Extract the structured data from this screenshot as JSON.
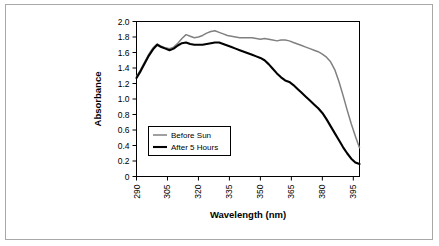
{
  "chart_data": {
    "type": "line",
    "title": "",
    "xlabel": "Wavelength (nm)",
    "ylabel": "Absorbance",
    "xlim": [
      290,
      398
    ],
    "ylim": [
      0,
      2.0
    ],
    "xticks": [
      290,
      305,
      320,
      335,
      350,
      365,
      380,
      395
    ],
    "xtick_labels": [
      "290",
      "305",
      "320",
      "335",
      "350",
      "365",
      "380",
      "395"
    ],
    "yticks": [
      0,
      0.2,
      0.4,
      0.6,
      0.8,
      1.0,
      1.2,
      1.4,
      1.6,
      1.8,
      2.0
    ],
    "ytick_labels": [
      "0",
      "0.2",
      "0.4",
      "0.6",
      "0.8",
      "1.0",
      "1.2",
      "1.4",
      "1.6",
      "1.8",
      "2.0"
    ],
    "grid": false,
    "legend_position": "center-left",
    "frame": true,
    "series": [
      {
        "name": "Before Sun",
        "color": "#808080",
        "x": [
          290,
          292,
          294,
          296,
          298,
          300,
          302,
          304,
          306,
          308,
          310,
          312,
          314,
          316,
          318,
          320,
          322,
          324,
          326,
          328,
          330,
          332,
          334,
          336,
          338,
          340,
          342,
          344,
          346,
          348,
          350,
          352,
          354,
          356,
          358,
          360,
          362,
          364,
          366,
          368,
          370,
          372,
          374,
          376,
          378,
          380,
          382,
          384,
          386,
          388,
          390,
          392,
          394,
          396,
          398
        ],
        "values": [
          1.29,
          1.38,
          1.48,
          1.58,
          1.66,
          1.71,
          1.68,
          1.66,
          1.65,
          1.67,
          1.72,
          1.78,
          1.83,
          1.81,
          1.79,
          1.8,
          1.82,
          1.85,
          1.87,
          1.88,
          1.86,
          1.84,
          1.82,
          1.81,
          1.8,
          1.79,
          1.79,
          1.79,
          1.79,
          1.78,
          1.77,
          1.78,
          1.77,
          1.76,
          1.75,
          1.76,
          1.76,
          1.75,
          1.73,
          1.71,
          1.69,
          1.67,
          1.65,
          1.63,
          1.61,
          1.58,
          1.54,
          1.48,
          1.38,
          1.23,
          1.05,
          0.86,
          0.68,
          0.52,
          0.37
        ]
      },
      {
        "name": "After 5 Hours",
        "color": "#000000",
        "x": [
          290,
          292,
          294,
          296,
          298,
          300,
          302,
          304,
          306,
          308,
          310,
          312,
          314,
          316,
          318,
          320,
          322,
          324,
          326,
          328,
          330,
          332,
          334,
          336,
          338,
          340,
          342,
          344,
          346,
          348,
          350,
          352,
          354,
          356,
          358,
          360,
          362,
          364,
          366,
          368,
          370,
          372,
          374,
          376,
          378,
          380,
          382,
          384,
          386,
          388,
          390,
          392,
          394,
          396,
          398
        ],
        "values": [
          1.27,
          1.36,
          1.46,
          1.56,
          1.64,
          1.7,
          1.67,
          1.65,
          1.63,
          1.65,
          1.69,
          1.72,
          1.73,
          1.71,
          1.7,
          1.7,
          1.7,
          1.71,
          1.72,
          1.73,
          1.73,
          1.71,
          1.69,
          1.67,
          1.65,
          1.63,
          1.61,
          1.59,
          1.57,
          1.55,
          1.53,
          1.5,
          1.45,
          1.39,
          1.33,
          1.28,
          1.24,
          1.22,
          1.18,
          1.13,
          1.08,
          1.03,
          0.98,
          0.93,
          0.88,
          0.82,
          0.74,
          0.65,
          0.56,
          0.47,
          0.38,
          0.3,
          0.23,
          0.18,
          0.16
        ]
      }
    ],
    "legend": [
      {
        "label": "Before Sun",
        "color": "#808080"
      },
      {
        "label": "After 5 Hours",
        "color": "#000000"
      }
    ]
  }
}
